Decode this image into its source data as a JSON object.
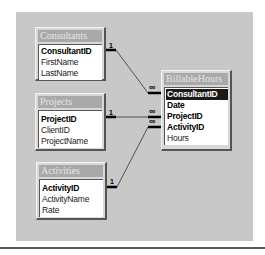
{
  "diagram": {
    "tables": [
      {
        "name": "Consultants",
        "fields": [
          {
            "label": "ConsultantID",
            "key": true,
            "selected": false
          },
          {
            "label": "FirstName",
            "key": false,
            "selected": false
          },
          {
            "label": "LastName",
            "key": false,
            "selected": false
          }
        ]
      },
      {
        "name": "Projects",
        "fields": [
          {
            "label": "ProjectID",
            "key": true,
            "selected": false
          },
          {
            "label": "ClientID",
            "key": false,
            "selected": false
          },
          {
            "label": "ProjectName",
            "key": false,
            "selected": false
          }
        ]
      },
      {
        "name": "Activities",
        "fields": [
          {
            "label": "ActivityID",
            "key": true,
            "selected": false
          },
          {
            "label": "ActivityName",
            "key": false,
            "selected": false
          },
          {
            "label": "Rate",
            "key": false,
            "selected": false
          }
        ]
      },
      {
        "name": "BillableHours",
        "fields": [
          {
            "label": "ConsultantID",
            "key": true,
            "selected": true
          },
          {
            "label": "Date",
            "key": true,
            "selected": false
          },
          {
            "label": "ProjectID",
            "key": true,
            "selected": false
          },
          {
            "label": "ActivityID",
            "key": true,
            "selected": false
          },
          {
            "label": "Hours",
            "key": false,
            "selected": false
          }
        ]
      }
    ],
    "relationships": [
      {
        "from": "Consultants.ConsultantID",
        "to": "BillableHours.ConsultantID",
        "one_label": "1",
        "many_label": "∞"
      },
      {
        "from": "Projects.ProjectID",
        "to": "BillableHours.ProjectID",
        "one_label": "1",
        "many_label": "∞"
      },
      {
        "from": "Activities.ActivityID",
        "to": "BillableHours.ActivityID",
        "one_label": "1",
        "many_label": "∞"
      }
    ],
    "colors": {
      "panel": "#c8c8c8",
      "title_bar": "#a9a9a9",
      "selected_row": "#1a1a1a"
    }
  }
}
